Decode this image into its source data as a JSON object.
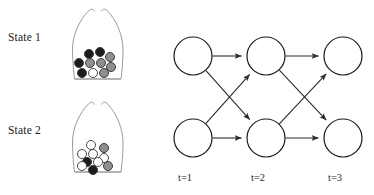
{
  "figure": {
    "left_panel": {
      "name": "urn-states",
      "states": [
        {
          "label": "State 1",
          "description": "urn containing mostly black and gray balls",
          "balls": [
            {
              "color": "#1c1c1c",
              "name": "black",
              "cx": 29,
              "cy": 49,
              "r": 5.2
            },
            {
              "color": "#1c1c1c",
              "name": "black",
              "cx": 40,
              "cy": 47,
              "r": 5.4
            },
            {
              "color": "#8f8f8f",
              "name": "gray",
              "cx": 50,
              "cy": 52,
              "r": 5.4
            },
            {
              "color": "#1c1c1c",
              "name": "black",
              "cx": 19,
              "cy": 58,
              "r": 5.4
            },
            {
              "color": "#8f8f8f",
              "name": "gray",
              "cx": 30,
              "cy": 58,
              "r": 5.2
            },
            {
              "color": "#8f8f8f",
              "name": "gray",
              "cx": 41,
              "cy": 58,
              "r": 5.4
            },
            {
              "color": "#8f8f8f",
              "name": "gray",
              "cx": 51,
              "cy": 62,
              "r": 5.2
            },
            {
              "color": "#1c1c1c",
              "name": "black",
              "cx": 22,
              "cy": 68,
              "r": 5.4
            },
            {
              "color": "#ffffff",
              "name": "white",
              "cx": 33,
              "cy": 68,
              "r": 5.2
            },
            {
              "color": "#8f8f8f",
              "name": "gray",
              "cx": 44,
              "cy": 68,
              "r": 5.2
            }
          ]
        },
        {
          "label": "State 2",
          "description": "urn containing mostly white balls",
          "balls": [
            {
              "color": "#ffffff",
              "name": "white",
              "cx": 31,
              "cy": 47,
              "r": 5.2
            },
            {
              "color": "#8f8f8f",
              "name": "gray",
              "cx": 44,
              "cy": 50,
              "r": 5.4
            },
            {
              "color": "#ffffff",
              "name": "white",
              "cx": 22,
              "cy": 56,
              "r": 5.2
            },
            {
              "color": "#ffffff",
              "name": "white",
              "cx": 33,
              "cy": 56,
              "r": 5.2
            },
            {
              "color": "#ffffff",
              "name": "white",
              "cx": 44,
              "cy": 60,
              "r": 5.2
            },
            {
              "color": "#1c1c1c",
              "name": "black",
              "cx": 27,
              "cy": 64,
              "r": 5.4
            },
            {
              "color": "#ffffff",
              "name": "white",
              "cx": 38,
              "cy": 64,
              "r": 5.2
            },
            {
              "color": "#8f8f8f",
              "name": "gray",
              "cx": 48,
              "cy": 68,
              "r": 5.2
            },
            {
              "color": "#1c1c1c",
              "name": "black",
              "cx": 33,
              "cy": 72,
              "r": 5.4
            },
            {
              "color": "#ffffff",
              "name": "white",
              "cx": 22,
              "cy": 68,
              "r": 5.2
            }
          ]
        }
      ]
    },
    "right_panel": {
      "name": "trellis-diagram",
      "time_labels": [
        "t=1",
        "t=2",
        "t=3"
      ],
      "nodes": [
        {
          "id": "n11",
          "col": 0,
          "row": 0,
          "cx": 25,
          "cy": 56
        },
        {
          "id": "n12",
          "col": 0,
          "row": 1,
          "cx": 25,
          "cy": 138
        },
        {
          "id": "n21",
          "col": 1,
          "row": 0,
          "cx": 98,
          "cy": 56
        },
        {
          "id": "n22",
          "col": 1,
          "row": 1,
          "cx": 98,
          "cy": 138
        },
        {
          "id": "n31",
          "col": 2,
          "row": 0,
          "cx": 175,
          "cy": 56
        },
        {
          "id": "n32",
          "col": 2,
          "row": 1,
          "cx": 175,
          "cy": 138
        }
      ],
      "edges": [
        {
          "from": "n11",
          "to": "n21"
        },
        {
          "from": "n11",
          "to": "n22"
        },
        {
          "from": "n12",
          "to": "n21"
        },
        {
          "from": "n12",
          "to": "n22"
        },
        {
          "from": "n21",
          "to": "n31"
        },
        {
          "from": "n21",
          "to": "n32"
        },
        {
          "from": "n22",
          "to": "n31"
        },
        {
          "from": "n22",
          "to": "n32"
        }
      ],
      "node_radius": 19,
      "node_fill": "#ffffff",
      "node_stroke": "#1a1a1a",
      "edge_stroke": "#2b2b2b"
    },
    "colors": {
      "black_ball": "#1c1c1c",
      "gray_ball": "#8f8f8f",
      "white_ball": "#ffffff",
      "urn_outline": "#9a9a9a",
      "text": "#1a1a1a"
    }
  }
}
